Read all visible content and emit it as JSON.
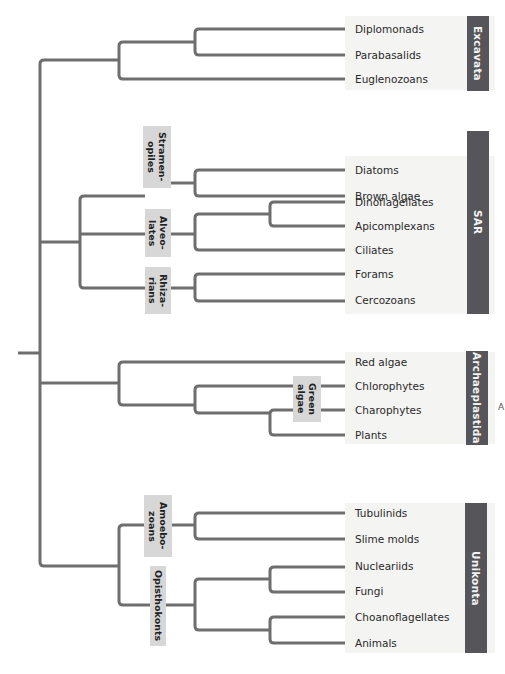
{
  "diagram": {
    "type": "phylogenetic-tree",
    "branch_color": "#6e6e6e",
    "supergroups": [
      {
        "name": "Excavata",
        "color": "#56565a",
        "taxa": [
          "Diplomonads",
          "Parabasalids",
          "Euglenozoans"
        ]
      },
      {
        "name": "SAR",
        "color": "#56565a",
        "subclades": [
          {
            "name": "Stramen-\nopiles",
            "taxa": [
              "Diatoms",
              "Brown algae"
            ]
          },
          {
            "name": "Alveo-\nlates",
            "taxa": [
              "Dinoflagellates",
              "Apicomplexans",
              "Ciliates"
            ]
          },
          {
            "name": "Rhiza-\nrians",
            "taxa": [
              "Forams",
              "Cercozoans"
            ]
          }
        ]
      },
      {
        "name": "Archaeplastida",
        "color": "#56565a",
        "taxa": [
          "Red algae",
          "Chlorophytes",
          "Charophytes",
          "Plants"
        ],
        "subclades": [
          {
            "name": "Green\nalgae",
            "taxa": [
              "Chlorophytes",
              "Charophytes"
            ]
          }
        ]
      },
      {
        "name": "Unikonta",
        "color": "#56565a",
        "subclades": [
          {
            "name": "Amoebo-\nzoans",
            "taxa": [
              "Tubulinids",
              "Slime molds"
            ]
          },
          {
            "name": "Opisthokonts",
            "taxa": [
              "Nucleariids",
              "Fungi",
              "Choanoflagellates",
              "Animals"
            ]
          }
        ]
      }
    ],
    "leaves": [
      "Diplomonads",
      "Parabasalids",
      "Euglenozoans",
      "Diatoms",
      "Brown algae",
      "Dinoflagellates",
      "Apicomplexans",
      "Ciliates",
      "Forams",
      "Cercozoans",
      "Red algae",
      "Chlorophytes",
      "Charophytes",
      "Plants",
      "Tubulinids",
      "Slime molds",
      "Nucleariids",
      "Fungi",
      "Choanoflagellates",
      "Animals"
    ],
    "group_labels": {
      "excavata": "Excavata",
      "sar": "SAR",
      "archaeplastida": "Archaeplastida",
      "unikonta": "Unikonta"
    },
    "clade_labels": {
      "stramenopiles": "Stramen-\nopiles",
      "alveolates": "Alveo-\nlates",
      "rhizarians": "Rhiza-\nrians",
      "green_algae": "Green\nalgae",
      "amoebozoans": "Amoebo-\nzoans",
      "opisthokonts": "Opisthokonts"
    },
    "stray_mark": "A"
  }
}
